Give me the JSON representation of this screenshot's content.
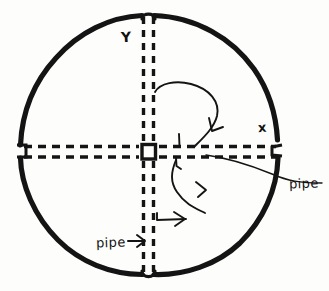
{
  "figure": {
    "kind": "hand-drawn-schematic",
    "background_color": "#fdfdfc",
    "ink_color": "#141414",
    "width": 329,
    "height": 291
  },
  "vessel": {
    "name": "circular-tank-outline",
    "shape": "circle",
    "center_x": 149,
    "center_y": 145,
    "radius": 131,
    "stroke_width": 5,
    "ports": [
      {
        "name": "top-port",
        "x": 148,
        "y": 15
      },
      {
        "name": "bottom-port",
        "x": 148,
        "y": 274
      },
      {
        "name": "left-port",
        "x": 20,
        "y": 151
      },
      {
        "name": "right-port",
        "x": 278,
        "y": 149
      }
    ]
  },
  "pipes": {
    "vertical": {
      "name": "vertical-pipe",
      "orientation": "vertical",
      "wall_x": [
        143,
        153
      ],
      "y_start": 16,
      "y_end": 274,
      "style": "dashed"
    },
    "horizontal": {
      "name": "horizontal-pipe",
      "orientation": "horizontal",
      "wall_y": [
        146,
        156
      ],
      "x_start": 21,
      "x_end": 279,
      "style": "dashed"
    },
    "junction": {
      "name": "pipe-junction",
      "x": 148,
      "y": 151
    }
  },
  "flow_arrows": [
    {
      "name": "upper-flow-arrow",
      "direction": "clockwise-down-into-horizontal-pipe"
    },
    {
      "name": "lower-flow-arrow",
      "direction": "up-into-horizontal-pipe"
    },
    {
      "name": "lower-left-feed-arrow",
      "direction": "right"
    }
  ],
  "labels": {
    "y_axis": "Y",
    "x_axis": "x",
    "pipe_right": "pipe",
    "pipe_bottom": "pipe"
  },
  "leaders": {
    "pipe_right_leader": {
      "name": "pipe-right-leader-line",
      "from": [
        288,
        182
      ],
      "to": [
        205,
        156
      ]
    },
    "pipe_bottom_arrow": {
      "name": "pipe-bottom-leader-arrow",
      "from": [
        130,
        241
      ],
      "to": [
        144,
        241
      ]
    }
  }
}
